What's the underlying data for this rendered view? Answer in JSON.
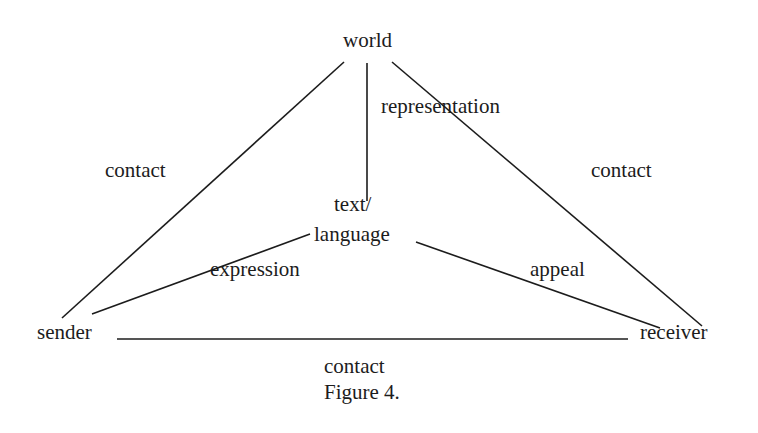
{
  "diagram": {
    "nodes": {
      "world": "world",
      "text_line1": "text/",
      "text_line2": "language",
      "sender": "sender",
      "receiver": "receiver"
    },
    "edge_labels": {
      "world_text": "representation",
      "world_sender": "contact",
      "world_receiver": "contact",
      "text_sender": "expression",
      "text_receiver": "appeal",
      "sender_receiver": "contact"
    },
    "caption": "Figure 4.",
    "line_color": "#1c1c1c"
  }
}
